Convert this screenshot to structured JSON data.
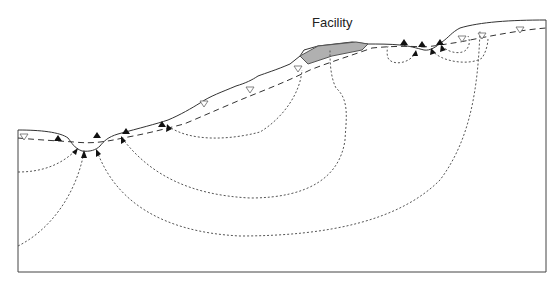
{
  "diagram": {
    "type": "groundwater-flow-cross-section",
    "labels": {
      "facility": "Facility"
    },
    "colors": {
      "line": "#333333",
      "facility_fill": "#b0b0b0",
      "flow_line": "#444444",
      "background": "#ffffff"
    },
    "legend_symbols": {
      "water_table_marker": "open-inverted-triangle",
      "discharge_marker": "filled-triangle",
      "flow_arrow": "filled-arrowhead"
    }
  }
}
